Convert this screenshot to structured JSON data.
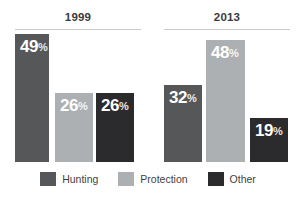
{
  "chart_data": {
    "type": "bar",
    "title": "",
    "subtitle": "",
    "xlabel": "",
    "ylabel": "",
    "grid": false,
    "legend_position": "bottom",
    "ylim": [
      0,
      50
    ],
    "value_suffix": "%",
    "categories": [
      "1999",
      "2013"
    ],
    "series": [
      {
        "name": "Hunting",
        "color": "#555759",
        "values": [
          49,
          32
        ]
      },
      {
        "name": "Protection",
        "color": "#adb0b2",
        "values": [
          26,
          48
        ]
      },
      {
        "name": "Other",
        "color": "#2b2b2d",
        "values": [
          26,
          19
        ]
      }
    ],
    "groups": [
      {
        "label": "1999",
        "bars": [
          {
            "series": "Hunting",
            "value": 49,
            "label_value": "49",
            "label_suffix": "%"
          },
          {
            "series": "Protection",
            "value": 26,
            "label_value": "26",
            "label_suffix": "%"
          },
          {
            "series": "Other",
            "value": 26,
            "label_value": "26",
            "label_suffix": "%"
          }
        ]
      },
      {
        "label": "2013",
        "bars": [
          {
            "series": "Hunting",
            "value": 32,
            "label_value": "32",
            "label_suffix": "%"
          },
          {
            "series": "Protection",
            "value": 48,
            "label_value": "48",
            "label_suffix": "%"
          },
          {
            "series": "Other",
            "value": 19,
            "label_value": "19",
            "label_suffix": "%"
          }
        ]
      }
    ]
  },
  "headers": {
    "group_1999": "1999",
    "group_2013": "2013"
  },
  "legend": {
    "items": [
      {
        "label": "Hunting",
        "color": "#555759"
      },
      {
        "label": "Protection",
        "color": "#adb0b2"
      },
      {
        "label": "Other",
        "color": "#2b2b2d"
      }
    ]
  },
  "colors": {
    "hunting": "#555759",
    "protection": "#adb0b2",
    "other": "#2b2b2d",
    "background": "#ffffff",
    "rule": "#c9c9c9",
    "header_text": "#3a3a3a",
    "legend_text": "#3f3f3f",
    "bar_label_text": "#ffffff"
  }
}
